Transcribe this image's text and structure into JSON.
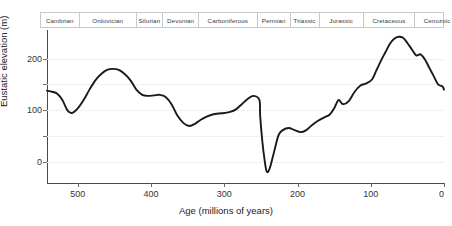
{
  "chart_data": {
    "type": "line",
    "title": "",
    "xlabel": "Age (millions of years)",
    "ylabel": "Eustatic elevation (m)",
    "xlim": [
      542,
      0
    ],
    "ylim": [
      -40,
      255
    ],
    "x_reversed": true,
    "grid": true,
    "legend": null,
    "x_ticks": [
      500,
      400,
      300,
      200,
      100,
      0
    ],
    "x_tick_labels": [
      "500",
      "400",
      "300",
      "200",
      "100",
      "0"
    ],
    "y_ticks": [
      0,
      50,
      100,
      150,
      200
    ],
    "y_tick_labels": [
      "0",
      "",
      "100",
      "",
      "200"
    ],
    "y_labeled_ticks": [
      0,
      100,
      200
    ],
    "series": [
      {
        "name": "Eustatic sea level",
        "x": [
          542,
          535,
          528,
          521,
          514,
          508,
          500,
          492,
          484,
          476,
          468,
          460,
          452,
          444,
          436,
          428,
          420,
          412,
          404,
          396,
          388,
          380,
          372,
          364,
          356,
          348,
          340,
          332,
          324,
          316,
          308,
          300,
          292,
          284,
          276,
          268,
          260,
          252,
          251,
          248,
          245,
          242,
          238,
          232,
          226,
          220,
          212,
          204,
          196,
          188,
          180,
          172,
          164,
          156,
          150,
          144,
          138,
          130,
          122,
          114,
          106,
          98,
          92,
          86,
          80,
          74,
          68,
          62,
          56,
          50,
          44,
          38,
          32,
          26,
          20,
          14,
          8,
          2,
          0
        ],
        "y": [
          138,
          136,
          132,
          120,
          100,
          95,
          104,
          120,
          140,
          158,
          170,
          178,
          180,
          178,
          170,
          158,
          140,
          130,
          128,
          129,
          130,
          126,
          112,
          90,
          76,
          70,
          74,
          82,
          88,
          92,
          94,
          95,
          97,
          102,
          112,
          122,
          128,
          120,
          90,
          40,
          5,
          -18,
          -12,
          20,
          52,
          62,
          66,
          62,
          58,
          62,
          72,
          80,
          86,
          92,
          104,
          120,
          112,
          118,
          136,
          148,
          152,
          160,
          178,
          196,
          212,
          228,
          238,
          242,
          240,
          230,
          218,
          206,
          208,
          198,
          182,
          166,
          150,
          146,
          140
        ],
        "color": "#1a1a1a",
        "style": "solid"
      }
    ],
    "annotations": []
  },
  "periods": {
    "label": "Geologic periods",
    "items": [
      {
        "name": "Cambrian",
        "start": 542,
        "end": 488,
        "width_pct": 9.6
      },
      {
        "name": "Ordovician",
        "start": 488,
        "end": 444,
        "width_pct": 14.2
      },
      {
        "name": "Silurian",
        "start": 444,
        "end": 416,
        "width_pct": 6.6
      },
      {
        "name": "Devonian",
        "start": 416,
        "end": 359,
        "width_pct": 8.9
      },
      {
        "name": "Carboniferous",
        "start": 359,
        "end": 299,
        "width_pct": 14.6
      },
      {
        "name": "Permian",
        "start": 299,
        "end": 251,
        "width_pct": 8.2
      },
      {
        "name": "Triassic",
        "start": 251,
        "end": 200,
        "width_pct": 7.2
      },
      {
        "name": "Jurassic",
        "start": 200,
        "end": 145,
        "width_pct": 11.0
      },
      {
        "name": "Cretaceous",
        "start": 145,
        "end": 65,
        "width_pct": 12.8
      },
      {
        "name": "Cenozoic",
        "start": 65,
        "end": 0,
        "width_pct": 10.9
      }
    ]
  },
  "colors": {
    "curve": "#1a1a1a",
    "axis": "#4a4a4a",
    "grid": "#f0f0f0",
    "border": "#c9c9c9",
    "background": "#ffffff",
    "text": "#222222"
  }
}
